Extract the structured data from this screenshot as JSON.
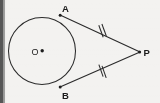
{
  "figure": {
    "kind": "geometry-diagram",
    "canvas": {
      "width": 160,
      "height": 103
    },
    "background_color": "#f3f2f0",
    "ink_color": "#2b2b2b",
    "left_margin_band": {
      "color": "#5a5a5a",
      "x": 0,
      "width": 4
    },
    "circle": {
      "label": "O",
      "center_label_x": 34,
      "center_label_y": 54,
      "center_x": 42,
      "center_y": 51,
      "radius": 34,
      "stroke_width": 1.05
    },
    "points": [
      {
        "id": "A",
        "label": "A",
        "x": 60,
        "y": 15,
        "label_x": 62,
        "label_y": 11,
        "dot": true
      },
      {
        "id": "B",
        "label": "B",
        "x": 60,
        "y": 87,
        "label_x": 62,
        "label_y": 98,
        "dot": true
      },
      {
        "id": "P",
        "label": "P",
        "x": 140,
        "y": 52,
        "label_x": 144,
        "label_y": 56,
        "dot": true
      },
      {
        "id": "O",
        "label": "O",
        "x": 42,
        "y": 51,
        "label_x": 32,
        "label_y": 54,
        "dot": true
      }
    ],
    "segments": [
      {
        "id": "AP",
        "from": "A",
        "to": "P",
        "x1": 60,
        "y1": 15,
        "x2": 140,
        "y2": 52,
        "tick_count": 2,
        "tick_label": "double-tick-congruence-mark"
      },
      {
        "id": "BP",
        "from": "B",
        "to": "P",
        "x1": 60,
        "y1": 87,
        "x2": 140,
        "y2": 52,
        "tick_count": 2,
        "tick_label": "double-tick-congruence-mark"
      }
    ],
    "tick_style": {
      "length": 9,
      "gap": 3.2,
      "stroke_width": 1.05
    }
  }
}
